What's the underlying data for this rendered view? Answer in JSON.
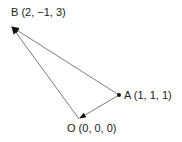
{
  "diagram": {
    "points": {
      "B": {
        "name": "B",
        "label": "B (2, −1, 3)",
        "coords": [
          2,
          -1,
          3
        ]
      },
      "A": {
        "name": "A",
        "label": "A (1, 1, 1)",
        "coords": [
          1,
          1,
          1
        ]
      },
      "O": {
        "name": "O",
        "label": "O (0, 0, 0)",
        "coords": [
          0,
          0,
          0
        ]
      }
    },
    "vectors": [
      {
        "from": "O",
        "to": "B"
      },
      {
        "from": "A",
        "to": "B"
      },
      {
        "from": "A",
        "to": "O"
      }
    ],
    "colors": {
      "line": "#6e6e6e",
      "text": "#222222",
      "point": "#111111"
    }
  }
}
